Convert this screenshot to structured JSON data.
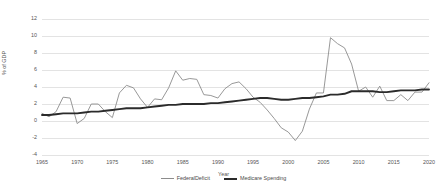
{
  "chart_data": {
    "type": "line",
    "title": "",
    "xlabel": "Year",
    "ylabel": "% of GDP",
    "xlim": [
      1965,
      2020
    ],
    "ylim": [
      -4,
      12
    ],
    "ytick_step": 2,
    "xtick_step": 5,
    "grid": true,
    "legend_position": "bottom",
    "xticks": [
      "1965",
      "1970",
      "1975",
      "1980",
      "1985",
      "1990",
      "1995",
      "2000",
      "2005",
      "2010",
      "2015",
      "2020"
    ],
    "yticks": [
      "-4",
      "-2",
      "0",
      "2",
      "4",
      "6",
      "8",
      "10",
      "12"
    ],
    "colors": {
      "deficit": "#8c8c8c",
      "medicare": "#2b2b2b",
      "gridline": "#e3e3e3"
    },
    "x": [
      1965,
      1966,
      1967,
      1968,
      1969,
      1970,
      1971,
      1972,
      1973,
      1974,
      1975,
      1976,
      1977,
      1978,
      1979,
      1980,
      1981,
      1982,
      1983,
      1984,
      1985,
      1986,
      1987,
      1988,
      1989,
      1990,
      1991,
      1992,
      1993,
      1994,
      1995,
      1996,
      1997,
      1998,
      1999,
      2000,
      2001,
      2002,
      2003,
      2004,
      2005,
      2006,
      2007,
      2008,
      2009,
      2010,
      2011,
      2012,
      2013,
      2014,
      2015,
      2016,
      2017,
      2018,
      2019,
      2020
    ],
    "series": [
      {
        "name": "FederalDeficit",
        "values": [
          0.9,
          0.5,
          1.1,
          2.8,
          2.7,
          -0.3,
          0.3,
          2.0,
          2.0,
          1.1,
          0.4,
          3.3,
          4.2,
          3.9,
          2.6,
          1.6,
          2.6,
          2.5,
          3.9,
          5.9,
          4.8,
          5.0,
          4.9,
          3.1,
          3.0,
          2.7,
          3.8,
          4.4,
          4.6,
          3.8,
          2.8,
          2.2,
          1.3,
          0.3,
          -0.8,
          -1.3,
          -2.3,
          -1.2,
          1.4,
          3.3,
          3.3,
          9.8,
          9.1,
          8.6,
          6.7,
          3.5,
          4.0,
          2.8,
          4.1,
          2.4,
          2.4,
          3.1,
          2.4,
          3.4,
          3.4,
          4.5
        ]
      },
      {
        "name": "Medicare Spending",
        "values": [
          0.7,
          0.7,
          0.8,
          0.9,
          0.9,
          0.9,
          1.0,
          1.1,
          1.1,
          1.2,
          1.3,
          1.4,
          1.5,
          1.5,
          1.5,
          1.6,
          1.7,
          1.8,
          1.9,
          1.9,
          2.0,
          2.0,
          2.0,
          2.0,
          2.1,
          2.1,
          2.2,
          2.3,
          2.4,
          2.5,
          2.6,
          2.7,
          2.7,
          2.6,
          2.5,
          2.5,
          2.6,
          2.7,
          2.7,
          2.8,
          2.9,
          3.1,
          3.1,
          3.2,
          3.5,
          3.5,
          3.5,
          3.5,
          3.4,
          3.4,
          3.5,
          3.6,
          3.6,
          3.6,
          3.7,
          3.7
        ]
      }
    ]
  },
  "legend": {
    "deficit_label": "FederalDeficit",
    "medicare_label": "Medicare Spending"
  }
}
